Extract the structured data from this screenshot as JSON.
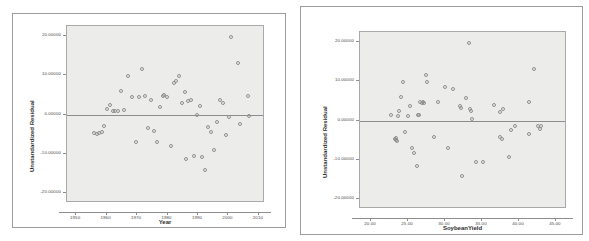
{
  "figure": {
    "type": "scatterplot-pair",
    "background_color": "#ffffff",
    "plot_fill_color": "#ececeb",
    "marker_color": "#8e8e90",
    "reference_line_color": "#8d8d8d"
  },
  "chart_data": [
    {
      "id": "residual-vs-year",
      "type": "scatter",
      "title": "",
      "xlabel": "Year",
      "ylabel": "Unstandardized Residual",
      "xlim": [
        1947,
        2012
      ],
      "ylim": [
        -22.5,
        22.5
      ],
      "xticks": [
        1950,
        1960,
        1970,
        1980,
        1990,
        2000,
        2010
      ],
      "xtick_labels": [
        "1950",
        "1960",
        "1970",
        "1980",
        "1990",
        "2000",
        "2010"
      ],
      "yticks": [
        20,
        10,
        0,
        -10,
        -20
      ],
      "ytick_labels": [
        "20.00000",
        "10.00000",
        "0.00000",
        "-10.00000",
        "-20.00000"
      ],
      "grid": false,
      "reference_line_y": 0,
      "points": [
        {
          "x": 1956.0,
          "y": -4.8
        },
        {
          "x": 1956.8,
          "y": -5.0
        },
        {
          "x": 1957.6,
          "y": -4.6
        },
        {
          "x": 1958.4,
          "y": -4.5
        },
        {
          "x": 1959.2,
          "y": -2.8
        },
        {
          "x": 1960.2,
          "y": 1.3
        },
        {
          "x": 1961.0,
          "y": 2.5
        },
        {
          "x": 1962.0,
          "y": 0.8
        },
        {
          "x": 1962.9,
          "y": 0.9
        },
        {
          "x": 1963.8,
          "y": 0.8
        },
        {
          "x": 1964.8,
          "y": 6.1
        },
        {
          "x": 1965.7,
          "y": 1.2
        },
        {
          "x": 1967.0,
          "y": 9.7
        },
        {
          "x": 1968.4,
          "y": 4.5
        },
        {
          "x": 1969.5,
          "y": -7.0
        },
        {
          "x": 1970.6,
          "y": 4.5
        },
        {
          "x": 1971.6,
          "y": 11.6
        },
        {
          "x": 1972.6,
          "y": 4.6
        },
        {
          "x": 1973.5,
          "y": -3.4
        },
        {
          "x": 1974.5,
          "y": 3.8
        },
        {
          "x": 1975.4,
          "y": -4.2
        },
        {
          "x": 1976.4,
          "y": -7.0
        },
        {
          "x": 1977.4,
          "y": 2.0
        },
        {
          "x": 1978.4,
          "y": 4.8
        },
        {
          "x": 1979.0,
          "y": 4.9
        },
        {
          "x": 1979.8,
          "y": 4.4
        },
        {
          "x": 1981.0,
          "y": -8.0
        },
        {
          "x": 1982.2,
          "y": 7.9
        },
        {
          "x": 1982.9,
          "y": 8.4
        },
        {
          "x": 1983.8,
          "y": 9.8
        },
        {
          "x": 1984.7,
          "y": 3.0
        },
        {
          "x": 1985.6,
          "y": 5.8
        },
        {
          "x": 1986.0,
          "y": -11.3
        },
        {
          "x": 1986.8,
          "y": 3.5
        },
        {
          "x": 1987.7,
          "y": 3.7
        },
        {
          "x": 1988.6,
          "y": -10.6
        },
        {
          "x": 1989.6,
          "y": 0.0
        },
        {
          "x": 1990.5,
          "y": 2.2
        },
        {
          "x": 1991.4,
          "y": -10.8
        },
        {
          "x": 1992.4,
          "y": -14.0
        },
        {
          "x": 1993.3,
          "y": -3.3
        },
        {
          "x": 1994.4,
          "y": -4.5
        },
        {
          "x": 1995.4,
          "y": -9.1
        },
        {
          "x": 1996.4,
          "y": -1.9
        },
        {
          "x": 1997.3,
          "y": 3.8
        },
        {
          "x": 1998.2,
          "y": 2.8
        },
        {
          "x": 1999.2,
          "y": -5.2
        },
        {
          "x": 2000.2,
          "y": -0.7
        },
        {
          "x": 2001.0,
          "y": 19.7
        },
        {
          "x": 2003.0,
          "y": 13.1
        },
        {
          "x": 2003.8,
          "y": -2.4
        },
        {
          "x": 2006.3,
          "y": 4.6
        },
        {
          "x": 2006.8,
          "y": -0.5
        }
      ]
    },
    {
      "id": "residual-vs-soybeanyield",
      "type": "scatter",
      "title": "",
      "xlabel": "SoybeanYield",
      "ylabel": "Unstandardized Residual",
      "xlim": [
        18.5,
        46.5
      ],
      "ylim": [
        -22.5,
        22.5
      ],
      "xticks": [
        20,
        25,
        30,
        35,
        40,
        45
      ],
      "xtick_labels": [
        "20.00",
        "25.00",
        "30.00",
        "35.00",
        "40.00",
        "45.00"
      ],
      "yticks": [
        20,
        10,
        0,
        -10,
        -20
      ],
      "ytick_labels": [
        "20.00000",
        "10.00000",
        "0.00000",
        "-10.00000",
        "-20.00000"
      ],
      "grid": false,
      "reference_line_y": 0,
      "points": [
        {
          "x": 22.7,
          "y": 1.3
        },
        {
          "x": 23.3,
          "y": -4.6
        },
        {
          "x": 23.4,
          "y": -4.4
        },
        {
          "x": 23.4,
          "y": -5.0
        },
        {
          "x": 23.5,
          "y": -5.3
        },
        {
          "x": 23.7,
          "y": 1.2
        },
        {
          "x": 23.8,
          "y": 2.5
        },
        {
          "x": 24.0,
          "y": 6.1
        },
        {
          "x": 24.3,
          "y": 9.7
        },
        {
          "x": 24.6,
          "y": -2.8
        },
        {
          "x": 25.0,
          "y": 1.2
        },
        {
          "x": 25.3,
          "y": 3.6
        },
        {
          "x": 25.6,
          "y": -7.0
        },
        {
          "x": 25.8,
          "y": -8.2
        },
        {
          "x": 26.2,
          "y": -11.5
        },
        {
          "x": 26.4,
          "y": 1.4
        },
        {
          "x": 26.5,
          "y": 1.3
        },
        {
          "x": 26.6,
          "y": 4.6
        },
        {
          "x": 26.9,
          "y": 4.5
        },
        {
          "x": 27.0,
          "y": 4.6
        },
        {
          "x": 27.1,
          "y": 4.5
        },
        {
          "x": 27.4,
          "y": 11.6
        },
        {
          "x": 27.6,
          "y": 9.8
        },
        {
          "x": 28.5,
          "y": -4.3
        },
        {
          "x": 29.0,
          "y": 4.6
        },
        {
          "x": 30.0,
          "y": 8.4
        },
        {
          "x": 30.4,
          "y": -7.0
        },
        {
          "x": 31.1,
          "y": 7.9
        },
        {
          "x": 32.0,
          "y": 3.7
        },
        {
          "x": 32.1,
          "y": 3.3
        },
        {
          "x": 32.3,
          "y": -14.0
        },
        {
          "x": 32.8,
          "y": 5.8
        },
        {
          "x": 33.2,
          "y": 19.6
        },
        {
          "x": 33.4,
          "y": 3.0
        },
        {
          "x": 33.5,
          "y": 2.3
        },
        {
          "x": 33.6,
          "y": 0.3
        },
        {
          "x": 34.2,
          "y": -10.5
        },
        {
          "x": 35.2,
          "y": -10.6
        },
        {
          "x": 36.6,
          "y": 4.0
        },
        {
          "x": 37.4,
          "y": 2.1
        },
        {
          "x": 37.5,
          "y": -4.2
        },
        {
          "x": 37.7,
          "y": -4.7
        },
        {
          "x": 37.8,
          "y": 2.8
        },
        {
          "x": 38.6,
          "y": -9.2
        },
        {
          "x": 38.9,
          "y": -2.5
        },
        {
          "x": 39.4,
          "y": -1.5
        },
        {
          "x": 41.3,
          "y": 4.6
        },
        {
          "x": 41.4,
          "y": -3.5
        },
        {
          "x": 42.0,
          "y": 13.1
        },
        {
          "x": 42.6,
          "y": -1.3
        },
        {
          "x": 42.9,
          "y": -2.2
        },
        {
          "x": 43.0,
          "y": -1.4
        }
      ]
    }
  ]
}
